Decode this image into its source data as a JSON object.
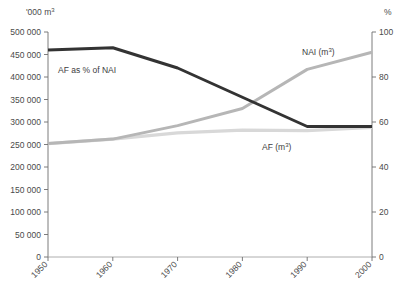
{
  "chart_data": {
    "type": "line",
    "title": "",
    "subtitle": "",
    "xlabel": "",
    "ylabel": "'000 m3",
    "y2label": "%",
    "x": [
      1950,
      1960,
      1970,
      1980,
      1990,
      2000
    ],
    "xticklabels": [
      "1950",
      "1960",
      "1970",
      "1980",
      "1990",
      "2000"
    ],
    "xlim": [
      1950,
      2000
    ],
    "ylim": [
      0,
      500000
    ],
    "yticks": [
      0,
      50000,
      100000,
      150000,
      200000,
      250000,
      300000,
      350000,
      400000,
      450000,
      500000
    ],
    "yticklabels": [
      "0",
      "50 000",
      "100 000",
      "150 000",
      "200 000",
      "250 000",
      "300 000",
      "350 000",
      "400 000",
      "450 000",
      "500 000"
    ],
    "y2lim": [
      0,
      100
    ],
    "y2ticks": [
      0,
      20,
      40,
      60,
      80,
      100
    ],
    "y2ticklabels": [
      "0",
      "20",
      "40",
      "60",
      "80",
      "100"
    ],
    "grid": false,
    "legend_position": "inline-annotations",
    "series": [
      {
        "name": "AF as % of NAI",
        "axis": "right",
        "unit": "%",
        "color": "#333333",
        "width": 3.0,
        "values": [
          92,
          93,
          84,
          71,
          58,
          58
        ],
        "label_text": "AF as % of NAI",
        "label_x": 58,
        "label_y": 73
      },
      {
        "name": "NAI (m3)",
        "axis": "left",
        "unit": "'000 m3",
        "color": "#b6b6b6",
        "width": 3.0,
        "values": [
          252000,
          262000,
          292000,
          330000,
          417000,
          455000
        ],
        "label_text": "NAI (m3)",
        "label_x": 302,
        "label_y": 55
      },
      {
        "name": "AF (m3)",
        "axis": "left",
        "unit": "'000 m3",
        "color": "#d8d8d8",
        "width": 3.2,
        "values": [
          252000,
          262000,
          276000,
          282000,
          281000,
          288000
        ],
        "label_text": "AF (m3)",
        "label_x": 262,
        "label_y": 150
      }
    ]
  },
  "axes": {
    "left_unit": "'000 m",
    "left_unit_sup": "3",
    "right_unit": "%"
  },
  "labels": {
    "af_pct_of_nai": "AF as % of NAI",
    "nai_base": "NAI (m",
    "nai_sup": "3",
    "nai_tail": ")",
    "af_base": "AF (m",
    "af_sup": "3",
    "af_tail": ")"
  }
}
